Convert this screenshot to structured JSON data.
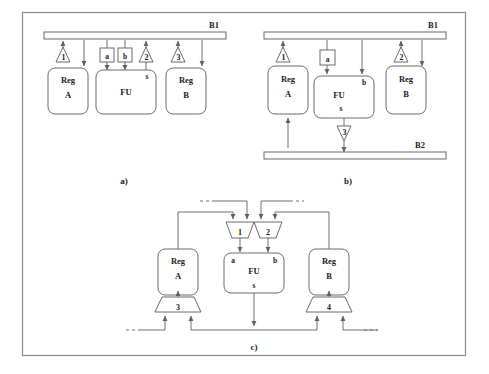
{
  "figure": {
    "captions": [
      {
        "id": "cap-a",
        "text": "a)"
      },
      {
        "id": "cap-b",
        "text": "b)"
      },
      {
        "id": "cap-c",
        "text": "c)"
      }
    ]
  },
  "diagram_a": {
    "caption": "a)",
    "buses": [
      {
        "name": "B1",
        "label": "B1"
      }
    ],
    "blocks": [
      {
        "name": "reg-a",
        "line1": "Reg",
        "line2": "A"
      },
      {
        "name": "fu",
        "line1": "FU",
        "line2": ""
      },
      {
        "name": "reg-b",
        "line1": "Reg",
        "line2": "B"
      }
    ],
    "latches": [
      {
        "name": "latch-a",
        "label": "a"
      },
      {
        "name": "latch-b",
        "label": "b"
      }
    ],
    "ports": [
      {
        "name": "fu-out",
        "label": "s"
      }
    ],
    "buffers": [
      {
        "name": "buffer-1",
        "label": "1"
      },
      {
        "name": "buffer-2",
        "label": "2"
      },
      {
        "name": "buffer-3",
        "label": "3"
      }
    ]
  },
  "diagram_b": {
    "caption": "b)",
    "buses": [
      {
        "name": "B1",
        "label": "B1"
      },
      {
        "name": "B2",
        "label": "B2"
      }
    ],
    "blocks": [
      {
        "name": "reg-a",
        "line1": "Reg",
        "line2": "A"
      },
      {
        "name": "fu",
        "line1": "FU",
        "line2": ""
      },
      {
        "name": "reg-b",
        "line1": "Reg",
        "line2": "B"
      }
    ],
    "latches": [
      {
        "name": "latch-a",
        "label": "a"
      }
    ],
    "ports": [
      {
        "name": "fu-in-b",
        "label": "b"
      },
      {
        "name": "fu-out",
        "label": "s"
      }
    ],
    "buffers": [
      {
        "name": "buffer-1",
        "label": "1"
      },
      {
        "name": "buffer-2",
        "label": "2"
      },
      {
        "name": "buffer-3",
        "label": "3"
      }
    ]
  },
  "diagram_c": {
    "caption": "c)",
    "blocks": [
      {
        "name": "reg-a",
        "line1": "Reg",
        "line2": "A"
      },
      {
        "name": "fu",
        "line1": "FU",
        "line2": ""
      },
      {
        "name": "reg-b",
        "line1": "Reg",
        "line2": "B"
      }
    ],
    "ports": [
      {
        "name": "fu-in-a",
        "label": "a"
      },
      {
        "name": "fu-in-b",
        "label": "b"
      },
      {
        "name": "fu-out",
        "label": "s"
      }
    ],
    "muxes": [
      {
        "name": "mux-1",
        "label": "1",
        "orientation": "down"
      },
      {
        "name": "mux-2",
        "label": "2",
        "orientation": "down"
      },
      {
        "name": "mux-3",
        "label": "3",
        "orientation": "up"
      },
      {
        "name": "mux-4",
        "label": "4",
        "orientation": "up"
      }
    ]
  },
  "colors": {
    "stroke": "#6b6b6b",
    "wire": "#6f6f6f",
    "frame": "#8a8a8a",
    "text": "#1a1a1a",
    "fill": "#ffffff"
  }
}
